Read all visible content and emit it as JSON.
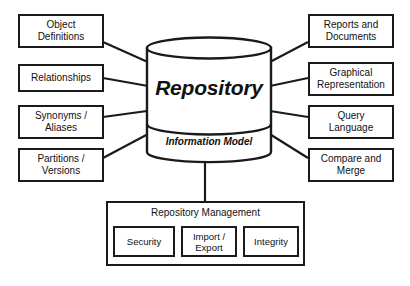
{
  "diagram": {
    "type": "architecture-block-diagram",
    "background_color": "#ffffff",
    "stroke_color": "#1a1a1a",
    "text_color": "#111111"
  },
  "center": {
    "shape": "cylinder",
    "title": "Repository",
    "subtitle": "Information Model"
  },
  "left_nodes": [
    {
      "id": "object-definitions",
      "label": "Object\nDefinitions"
    },
    {
      "id": "relationships",
      "label": "Relationships"
    },
    {
      "id": "synonyms-aliases",
      "label": "Synonyms /\nAliases"
    },
    {
      "id": "partitions-versions",
      "label": "Partitions /\nVersions"
    }
  ],
  "right_nodes": [
    {
      "id": "reports-documents",
      "label": "Reports and\nDocuments"
    },
    {
      "id": "graphical-representation",
      "label": "Graphical\nRepresentation"
    },
    {
      "id": "query-language",
      "label": "Query\nLanguage"
    },
    {
      "id": "compare-merge",
      "label": "Compare and\nMerge"
    }
  ],
  "management": {
    "title": "Repository Management",
    "items": [
      {
        "id": "security",
        "label": "Security"
      },
      {
        "id": "import-export",
        "label": "Import /\nExport"
      },
      {
        "id": "integrity",
        "label": "Integrity"
      }
    ]
  }
}
